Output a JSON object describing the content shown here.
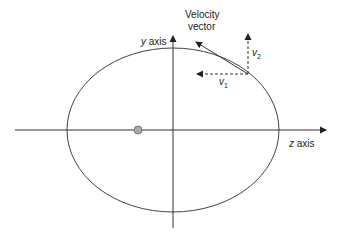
{
  "diagram": {
    "labels": {
      "velocity_line1": "Velocity",
      "velocity_line2": "vector",
      "y_axis_var": "y",
      "y_axis_word": " axis",
      "z_axis_var": "z",
      "z_axis_word": " axis",
      "v1_symbol": "v",
      "v1_sub": "1",
      "v2_symbol": "v",
      "v2_sub": "2"
    },
    "elements": {
      "ellipse": {
        "cx": 173,
        "cy": 130,
        "rx": 106,
        "ry": 82,
        "stroke": "#444444"
      },
      "focus_body": {
        "cx": 138,
        "cy": 130,
        "r": 4,
        "fill": "#aaaaaa",
        "stroke": "#666666"
      },
      "z_axis": {
        "x1": 15,
        "y1": 130,
        "x2": 327,
        "y2": 130
      },
      "y_axis": {
        "x1": 173,
        "y1": 228,
        "x2": 173,
        "y2": 35
      },
      "velocity_vector": {
        "from": [
          248,
          74
        ],
        "to": [
          195,
          41
        ]
      },
      "v1_component": {
        "from": [
          248,
          74
        ],
        "to": [
          196,
          74
        ],
        "style": "dashed"
      },
      "v2_component": {
        "from": [
          248,
          74
        ],
        "to": [
          248,
          33
        ],
        "style": "dashed"
      }
    },
    "colors": {
      "line": "#333333",
      "background": "#ffffff",
      "text": "#222222"
    }
  }
}
